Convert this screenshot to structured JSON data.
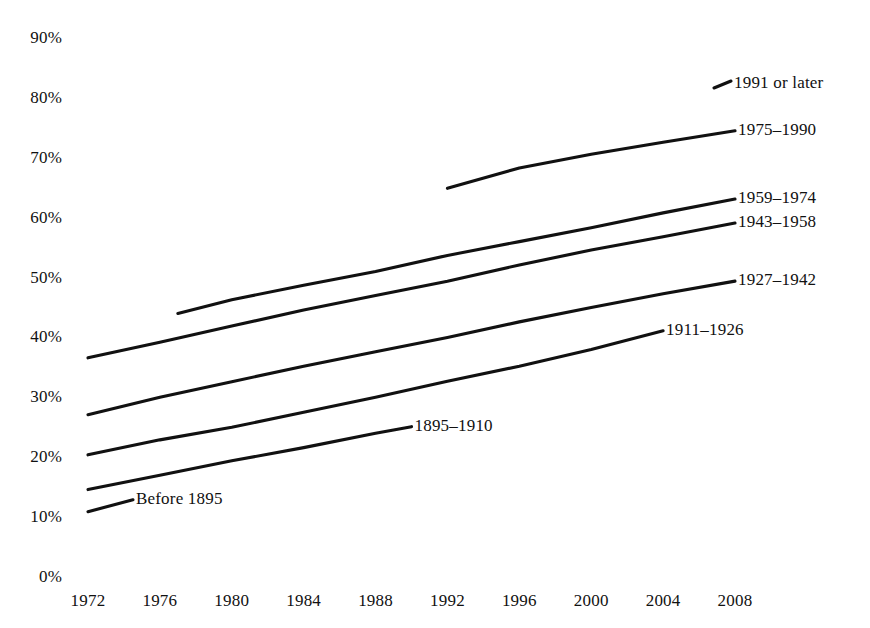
{
  "chart_data": {
    "type": "line",
    "title": "",
    "subtitle": "",
    "xlabel": "",
    "ylabel": "",
    "xlim": [
      1972,
      2008
    ],
    "ylim": [
      0,
      90
    ],
    "grid": false,
    "legend_position": "inline-right-of-line-end",
    "x_ticks": [
      "1972",
      "1976",
      "1980",
      "1984",
      "1988",
      "1992",
      "1996",
      "2000",
      "2004",
      "2008"
    ],
    "y_ticks": [
      "0%",
      "10%",
      "20%",
      "30%",
      "40%",
      "50%",
      "60%",
      "70%",
      "80%",
      "90%"
    ],
    "series": [
      {
        "name": "1991 or later",
        "label": "1991 or later",
        "label_only": true,
        "x": [],
        "values": []
      },
      {
        "name": "1975-1990",
        "label": "1975–1990",
        "label_only": false,
        "x": [
          1992.0,
          1996.0,
          2000.0,
          2004.0,
          2008.0
        ],
        "values": [
          64.9,
          68.3,
          70.6,
          72.6,
          74.5
        ]
      },
      {
        "name": "1959-1974",
        "label": "1959–1974",
        "label_only": false,
        "x": [
          1977.0,
          1980.0,
          1984.0,
          1988.0,
          1992.0,
          1996.0,
          2000.0,
          2004.0,
          2008.0
        ],
        "values": [
          44.0,
          46.3,
          48.7,
          51.0,
          53.7,
          56.0,
          58.3,
          60.8,
          63.1
        ]
      },
      {
        "name": "1943-1958",
        "label": "1943–1958",
        "label_only": false,
        "x": [
          1972.0,
          1976.0,
          1980.0,
          1984.0,
          1988.0,
          1992.0,
          1996.0,
          2000.0,
          2004.0,
          2008.0
        ],
        "values": [
          36.6,
          39.2,
          41.9,
          44.6,
          47.0,
          49.4,
          52.1,
          54.6,
          56.8,
          59.1
        ]
      },
      {
        "name": "1927-1942",
        "label": "1927–1942",
        "label_only": false,
        "x": [
          1972.0,
          1976.0,
          1980.0,
          1984.0,
          1988.0,
          1992.0,
          1996.0,
          2000.0,
          2004.0,
          2008.0
        ],
        "values": [
          27.1,
          30.0,
          32.6,
          35.2,
          37.6,
          40.0,
          42.6,
          45.0,
          47.3,
          49.4
        ]
      },
      {
        "name": "1911-1926",
        "label": "1911–1926",
        "label_only": false,
        "x": [
          1972.0,
          1976.0,
          1980.0,
          1984.0,
          1988.0,
          1992.0,
          1996.0,
          2000.0,
          2004.0
        ],
        "values": [
          20.4,
          22.9,
          25.0,
          27.5,
          30.0,
          32.7,
          35.2,
          38.0,
          41.1
        ]
      },
      {
        "name": "1895-1910",
        "label": "1895–1910",
        "label_only": false,
        "x": [
          1972.0,
          1976.0,
          1980.0,
          1984.0,
          1988.0,
          1990.0
        ],
        "values": [
          14.6,
          17.0,
          19.4,
          21.6,
          24.0,
          25.1
        ]
      },
      {
        "name": "Before 1895",
        "label": "Before 1895",
        "label_only": false,
        "x": [
          1972.0,
          1974.5
        ],
        "values": [
          10.9,
          12.9
        ]
      }
    ]
  },
  "axis": {
    "y_ticks": [
      {
        "label": "90%",
        "value": 90
      },
      {
        "label": "80%",
        "value": 80
      },
      {
        "label": "70%",
        "value": 70
      },
      {
        "label": "60%",
        "value": 60
      },
      {
        "label": "50%",
        "value": 50
      },
      {
        "label": "40%",
        "value": 40
      },
      {
        "label": "30%",
        "value": 30
      },
      {
        "label": "20%",
        "value": 20
      },
      {
        "label": "10%",
        "value": 10
      },
      {
        "label": "0%",
        "value": 0
      }
    ],
    "x_ticks": [
      {
        "label": "1972",
        "value": 1972
      },
      {
        "label": "1976",
        "value": 1976
      },
      {
        "label": "1980",
        "value": 1980
      },
      {
        "label": "1984",
        "value": 1984
      },
      {
        "label": "1988",
        "value": 1988
      },
      {
        "label": "1992",
        "value": 1992
      },
      {
        "label": "1996",
        "value": 1996
      },
      {
        "label": "2000",
        "value": 2000
      },
      {
        "label": "2004",
        "value": 2004
      },
      {
        "label": "2008",
        "value": 2008
      }
    ]
  },
  "style": {
    "line_color": "#111111",
    "text_color": "#111111",
    "background": "#ffffff"
  }
}
